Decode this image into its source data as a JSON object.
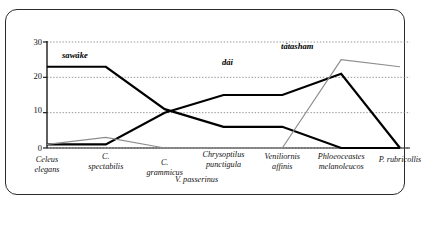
{
  "chart_data": {
    "type": "line",
    "title": "",
    "xlabel": "",
    "ylabel": "",
    "ylim": [
      0,
      30
    ],
    "yticks": [
      0,
      10,
      20,
      30
    ],
    "grid": true,
    "legend_position": "inline-annotations",
    "categories": [
      "Celeus elegans",
      "C. spectabilis",
      "C. grammicus",
      "Chrysoptilus punctigula",
      "Veniliornis affinis",
      "Phloeoceastes melanoleucos",
      "P. rubricollis"
    ],
    "category_lines": [
      [
        "Celeus",
        "elegans"
      ],
      [
        "C.",
        "spectabilis"
      ],
      [
        "C.",
        "grammicus"
      ],
      [
        "Chrysoptilus",
        "punctigula"
      ],
      [
        "Veniliornis",
        "affinis"
      ],
      [
        "Phloeoceastes",
        "melanoleucos"
      ],
      [
        "P. rubricollis",
        ""
      ]
    ],
    "center_note": "V.  passerinus",
    "series": [
      {
        "name": "sawáke",
        "color": "#000000",
        "width": 2.2,
        "values": [
          23,
          23,
          11,
          6,
          6,
          0,
          0
        ]
      },
      {
        "name": "dái",
        "color": "#000000",
        "width": 2.2,
        "values": [
          1,
          1,
          10,
          15,
          15,
          21,
          0
        ]
      },
      {
        "name": "tátasham",
        "color": "#8d8d8d",
        "width": 1.2,
        "values": [
          1,
          3,
          0,
          0,
          0,
          25,
          23
        ]
      }
    ],
    "annotations": [
      {
        "text": "sawáke",
        "x": 62,
        "y": 51
      },
      {
        "text": "dái",
        "x": 222,
        "y": 58
      },
      {
        "text": "tátasham",
        "x": 281,
        "y": 42
      }
    ]
  },
  "axis": {
    "ytick_labels": [
      "30",
      "20",
      "10",
      "0"
    ]
  }
}
